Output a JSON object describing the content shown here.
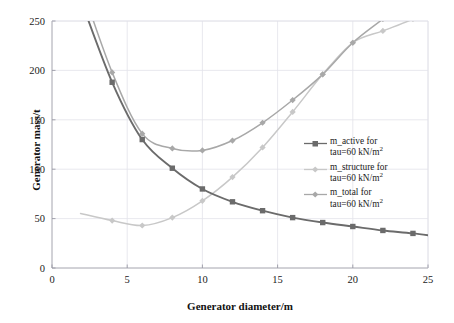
{
  "chart_data": {
    "type": "line",
    "title": "",
    "xlabel": "Generator diameter/m",
    "ylabel": "Generator mass/t",
    "xlim": [
      0,
      25
    ],
    "ylim": [
      0,
      250
    ],
    "xticks": [
      "0",
      "5",
      "10",
      "15",
      "20",
      "25"
    ],
    "yticks": [
      "0",
      "50",
      "100",
      "150",
      "200",
      "250"
    ],
    "grid": true,
    "legend_position": "right-middle",
    "x": [
      4,
      6,
      8,
      10,
      12,
      14,
      16,
      18,
      20,
      22,
      24
    ],
    "series": [
      {
        "name": "m_active for tau=60 kN/m2",
        "label_line1": "m_active for",
        "label_line2": "tau=60 kN/m",
        "label_exp": "2",
        "color": "#6b6b6b",
        "marker": "square",
        "values": [
          188,
          130,
          101,
          80,
          67,
          58,
          51,
          46,
          42,
          38,
          35
        ]
      },
      {
        "name": "m_structure for tau=60 kN/m2",
        "label_line1": "m_structure for",
        "label_line2": "tau=60 kN/m",
        "label_exp": "2",
        "color": "#c8c8c8",
        "marker": "diamond",
        "values": [
          48,
          43,
          51,
          68,
          92,
          122,
          158,
          196,
          228,
          240,
          252
        ]
      },
      {
        "name": "m_total for tau=60 kN/m2",
        "label_line1": "m_total for",
        "label_line2": "tau=60 kN/m",
        "label_exp": "2",
        "color": "#a8a8a8",
        "marker": "diamond",
        "values": [
          198,
          136,
          121,
          119,
          129,
          147,
          170,
          196,
          228,
          252,
          276
        ]
      }
    ]
  },
  "colors": {
    "grid": "#e2e2ea",
    "axis": "#9a9aa5",
    "text": "#1a1a1a"
  }
}
